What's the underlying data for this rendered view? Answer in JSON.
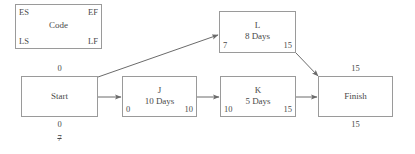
{
  "diagram": {
    "type": "project-network-diagram",
    "line_color": "#9a9a9a",
    "text_color": "#4a4a4a",
    "background": "#ffffff",
    "legend": {
      "name": "legend-key-box",
      "es_label": "ES",
      "ef_label": "EF",
      "code_label": "Code",
      "ls_label": "LS",
      "lf_label": "LF"
    },
    "nodes": [
      {
        "id": "start",
        "title": "Start",
        "duration": "",
        "top_outside": "0",
        "bottom_outside": "0",
        "bottom_outside_2": "7",
        "bottom_outside_2_struck": true,
        "es": "",
        "ef": "",
        "ls": "",
        "lf": ""
      },
      {
        "id": "j",
        "title": "J",
        "duration": "10 Days",
        "es": "0",
        "ef": "10"
      },
      {
        "id": "k",
        "title": "K",
        "duration": "5 Days",
        "es": "10",
        "ef": "15"
      },
      {
        "id": "l",
        "title": "L",
        "duration": "8 Days",
        "es": "7",
        "ef": "15"
      },
      {
        "id": "finish",
        "title": "Finish",
        "duration": "",
        "top_outside": "15",
        "bottom_outside": "15"
      }
    ],
    "edges": [
      {
        "from": "start",
        "to": "j",
        "style": "horizontal-arrow"
      },
      {
        "from": "j",
        "to": "k",
        "style": "horizontal-arrow"
      },
      {
        "from": "k",
        "to": "finish",
        "style": "horizontal-arrow"
      },
      {
        "from": "start",
        "to": "l",
        "style": "diagonal-arrow-up"
      },
      {
        "from": "l",
        "to": "finish",
        "style": "diagonal-arrow-down"
      }
    ]
  }
}
